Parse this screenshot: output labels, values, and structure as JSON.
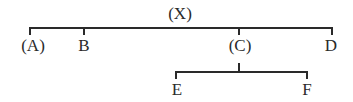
{
  "diagram": {
    "type": "tree",
    "root": {
      "label": "(X)",
      "children": [
        {
          "label": "(A)"
        },
        {
          "label": "B"
        },
        {
          "label": "(C)",
          "children": [
            {
              "label": "E"
            },
            {
              "label": "F"
            }
          ]
        },
        {
          "label": "D"
        }
      ]
    },
    "nodes": {
      "x": "(X)",
      "a": "(A)",
      "b": "B",
      "c": "(C)",
      "d": "D",
      "e": "E",
      "f": "F"
    },
    "line_color": "#2a2a2a"
  }
}
